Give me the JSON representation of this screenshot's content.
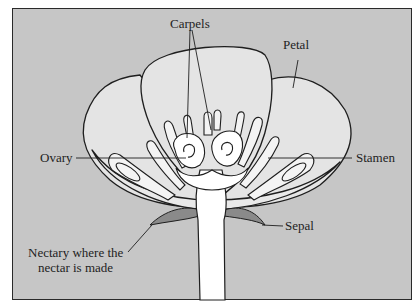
{
  "diagram": {
    "type": "labeled-illustration",
    "colors": {
      "background": "#c6c6c6",
      "petal_fill": "#e4e4e4",
      "inner_fill": "#f6f6f6",
      "stem_fill": "#ffffff",
      "sepal_fill": "#8a8a8a",
      "outline": "#1e1e1e"
    },
    "labels": {
      "carpels": "Carpels",
      "petal": "Petal",
      "ovary": "Ovary",
      "stamen": "Stamen",
      "sepal": "Sepal",
      "nectary_line1": "Nectary where the",
      "nectary_line2": "nectar is made"
    }
  }
}
